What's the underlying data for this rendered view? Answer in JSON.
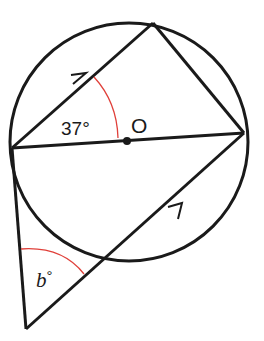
{
  "diagram": {
    "type": "geometry",
    "colors": {
      "stroke": "#1a1a1a",
      "angle_arc": "#e0403a",
      "background": "#ffffff"
    },
    "circle": {
      "cx": 129,
      "cy": 142,
      "r": 119
    },
    "points": {
      "left": [
        12,
        148
      ],
      "top": [
        153,
        23
      ],
      "right": [
        244,
        133
      ],
      "center": [
        127,
        141
      ],
      "bottom_ext": [
        26,
        329
      ],
      "secant_cross": [
        103,
        259
      ]
    },
    "labels": {
      "center": "O",
      "angle_top": "37°",
      "angle_bottom_var": "b",
      "angle_bottom_deg": "°"
    },
    "tick_marks": [
      "parallel-arrow-upper",
      "parallel-arrow-lower"
    ]
  }
}
